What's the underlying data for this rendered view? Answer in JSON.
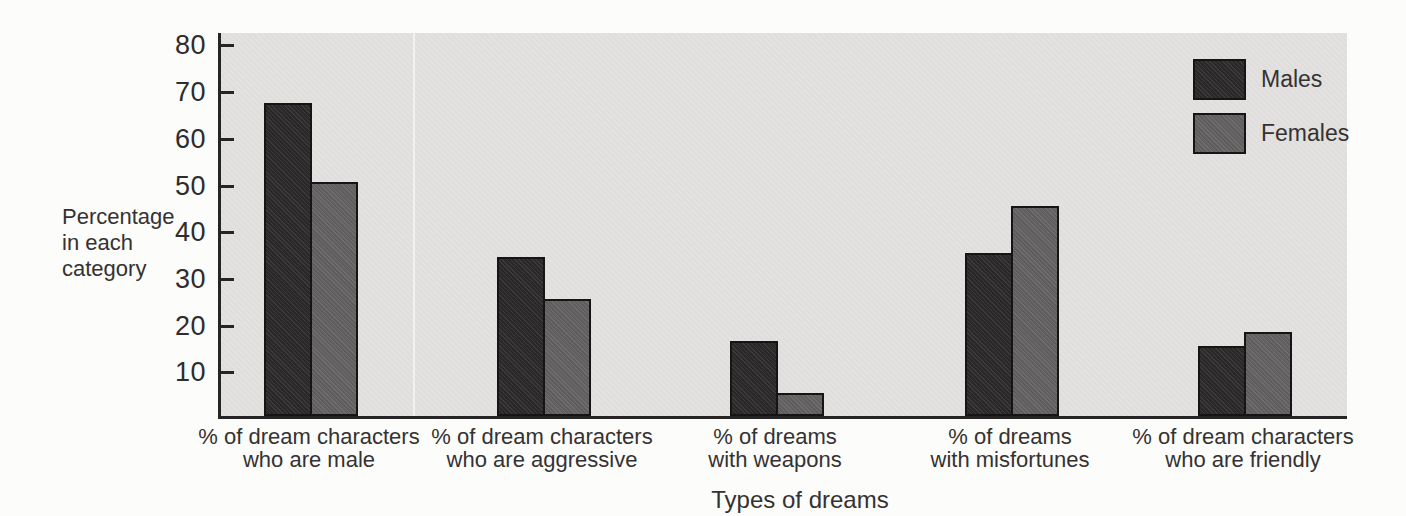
{
  "page": {
    "background": "#fcfcfa",
    "plot_background": "#e3e2e0",
    "axis_color": "#262424"
  },
  "chart_data": {
    "type": "bar",
    "title": "",
    "categories": [
      "% of dream characters\nwho are male",
      "% of dream characters\nwho are aggressive",
      "% of dreams\nwith weapons",
      "% of dreams\nwith misfortunes",
      "% of dream characters\nwho are friendly"
    ],
    "series": [
      {
        "name": "Males",
        "color": "#2b2929",
        "values": [
          67,
          34,
          16,
          35,
          15
        ]
      },
      {
        "name": "Females",
        "color": "#636161",
        "values": [
          50,
          25,
          5,
          45,
          18
        ]
      }
    ],
    "ylabel": "Percentage\nin each\ncategory",
    "xlabel": "Types of dreams",
    "yticks": [
      10,
      20,
      30,
      40,
      50,
      60,
      70,
      80
    ],
    "ylim": [
      0,
      82.5
    ],
    "grid": false,
    "legend_position": "top-right",
    "bar_border_color": "#161414"
  }
}
